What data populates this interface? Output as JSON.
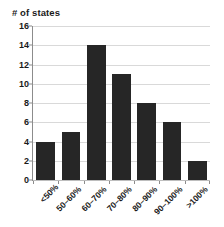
{
  "chart_data": {
    "type": "bar",
    "title": "# of states",
    "xlabel": "",
    "ylabel": "# of states",
    "categories": [
      "<50%",
      "50–60%",
      "60–70%",
      "70–80%",
      "80–90%",
      "90–100%",
      ">100%"
    ],
    "values": [
      4,
      5,
      14,
      11,
      8,
      6,
      2
    ],
    "ylim": [
      0,
      16
    ],
    "ytick_values": [
      0,
      2,
      4,
      6,
      8,
      10,
      12,
      14,
      16
    ],
    "ytick_labels": [
      "0",
      "2",
      "4",
      "6",
      "8",
      "10",
      "12",
      "14",
      "16"
    ],
    "grid": true,
    "legend": false,
    "bar_color": "#262626",
    "gridline_color": "#d9d9d9",
    "axis_color": "#8c8c8c",
    "background_color": "#ffffff",
    "text_color": "#1a1a1a",
    "xtick_label_rotation": -45
  }
}
